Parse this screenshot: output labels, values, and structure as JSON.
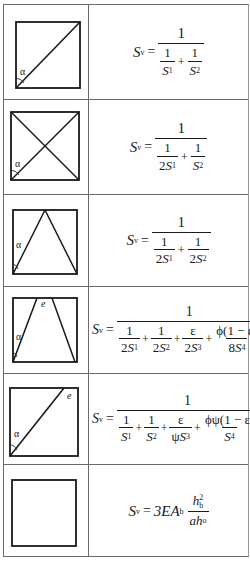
{
  "table": {
    "rows": [
      {
        "figure": {
          "type": "single-diagonal",
          "angle_label": "α"
        },
        "formula": {
          "lhs": "S",
          "lhs_sub": "v",
          "eq": "=",
          "numerator": "1",
          "terms": [
            {
              "num": "1",
              "den_coef": "",
              "den_var": "S",
              "den_sub": "1"
            },
            {
              "num": "1",
              "den_coef": "",
              "den_var": "S",
              "den_sub": "2"
            }
          ],
          "text": "S_v = 1 / (1/S_1 + 1/S_2)"
        }
      },
      {
        "figure": {
          "type": "x-bracing",
          "angle_label": "α"
        },
        "formula": {
          "lhs": "S",
          "lhs_sub": "v",
          "eq": "=",
          "numerator": "1",
          "terms": [
            {
              "num": "1",
              "den_coef": "2",
              "den_var": "S",
              "den_sub": "1"
            },
            {
              "num": "1",
              "den_coef": "",
              "den_var": "S",
              "den_sub": "2"
            }
          ],
          "text": "S_v = 1 / (1/(2S_1) + 1/S_2)"
        }
      },
      {
        "figure": {
          "type": "chevron",
          "angle_label": "α"
        },
        "formula": {
          "lhs": "S",
          "lhs_sub": "v",
          "eq": "=",
          "numerator": "1",
          "terms": [
            {
              "num": "1",
              "den_coef": "2",
              "den_var": "S",
              "den_sub": "1"
            },
            {
              "num": "1",
              "den_coef": "2",
              "den_var": "S",
              "den_sub": "2"
            }
          ],
          "text": "S_v = 1 / (1/(2S_1) + 1/(2S_2))"
        }
      },
      {
        "figure": {
          "type": "k-bracing-eccentric",
          "angle_label": "α",
          "ecc_label": "e"
        },
        "formula": {
          "lhs": "S",
          "lhs_sub": "v",
          "eq": "=",
          "numerator": "1",
          "terms": [
            {
              "num": "1",
              "den_coef": "2",
              "den_var": "S",
              "den_sub": "1"
            },
            {
              "num": "1",
              "den_coef": "2",
              "den_var": "S",
              "den_sub": "2"
            },
            {
              "num": "ε",
              "den_coef": "2",
              "den_var": "S",
              "den_sub": "3"
            },
            {
              "num": "ϕ(1 − ε)",
              "den_coef": "8",
              "den_var": "S",
              "den_sub": "4"
            }
          ],
          "text": "S_v = 1 / (1/(2S_1) + 1/(2S_2) + ε/(2S_3) + ϕ(1−ε)/(8S_4))"
        }
      },
      {
        "figure": {
          "type": "diagonal-eccentric",
          "angle_label": "α",
          "ecc_label": "e"
        },
        "formula": {
          "lhs": "S",
          "lhs_sub": "v",
          "eq": "=",
          "numerator": "1",
          "terms": [
            {
              "num": "1",
              "den_coef": "",
              "den_var": "S",
              "den_sub": "1"
            },
            {
              "num": "1",
              "den_coef": "",
              "den_var": "S",
              "den_sub": "2"
            },
            {
              "num": "ε",
              "den_coef": "ψ",
              "den_var": "S",
              "den_sub": "3"
            },
            {
              "num": "ϕψ(1 − ε)",
              "den_coef": "",
              "den_var": "S",
              "den_sub": "4"
            }
          ],
          "text": "S_v = 1 / (1/S_1 + 1/S_2 + ε/(ψS_3) + ϕψ(1−ε)/S_4)"
        }
      },
      {
        "figure": {
          "type": "empty-frame"
        },
        "formula": {
          "lhs": "S",
          "lhs_sub": "v",
          "eq": "=",
          "coef": "3EA",
          "coef_sub": "b",
          "num": "h",
          "num_sub": "b",
          "num_sup": "2",
          "den": "ah",
          "den_sub": "o",
          "text": "S_v = 3EA_b · h_b² / (a h_o)"
        }
      }
    ]
  }
}
